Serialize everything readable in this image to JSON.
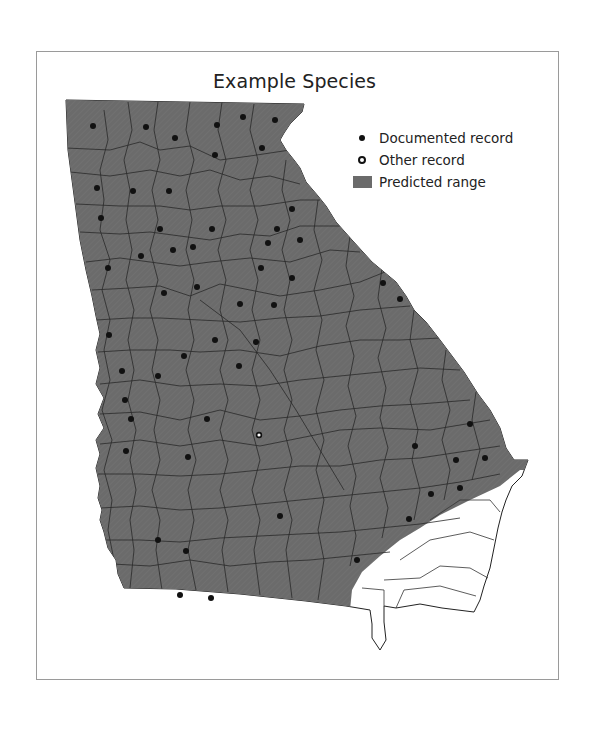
{
  "title": "Example Species",
  "legend": {
    "items": [
      {
        "symbol": "filled-dot",
        "label": "Documented record"
      },
      {
        "symbol": "open-dot",
        "label": "Other record"
      },
      {
        "symbol": "gray-swatch",
        "label": "Predicted range"
      }
    ]
  },
  "colors": {
    "range_fill": "#6b6b6b",
    "county_line": "#2a2a2a",
    "outside_range": "#ffffff",
    "frame": "#9a9a9a",
    "record_dot": "#111111"
  },
  "map": {
    "region": "Georgia (US state) by county",
    "documented_records": [
      [
        93,
        126
      ],
      [
        146,
        127
      ],
      [
        175,
        138
      ],
      [
        217,
        125
      ],
      [
        243,
        117
      ],
      [
        275,
        120
      ],
      [
        215,
        155
      ],
      [
        262,
        148
      ],
      [
        97,
        188
      ],
      [
        133,
        191
      ],
      [
        169,
        191
      ],
      [
        292,
        209
      ],
      [
        101,
        218
      ],
      [
        160,
        229
      ],
      [
        212,
        229
      ],
      [
        277,
        229
      ],
      [
        268,
        243
      ],
      [
        300,
        240
      ],
      [
        141,
        256
      ],
      [
        173,
        250
      ],
      [
        193,
        247
      ],
      [
        108,
        268
      ],
      [
        261,
        268
      ],
      [
        197,
        287
      ],
      [
        292,
        278
      ],
      [
        383,
        283
      ],
      [
        400,
        299
      ],
      [
        164,
        293
      ],
      [
        240,
        304
      ],
      [
        274,
        305
      ],
      [
        109,
        335
      ],
      [
        215,
        340
      ],
      [
        256,
        342
      ],
      [
        184,
        356
      ],
      [
        239,
        366
      ],
      [
        122,
        371
      ],
      [
        158,
        376
      ],
      [
        125,
        400
      ],
      [
        131,
        419
      ],
      [
        207,
        419
      ],
      [
        470,
        424
      ],
      [
        415,
        446
      ],
      [
        456,
        460
      ],
      [
        485,
        458
      ],
      [
        126,
        451
      ],
      [
        188,
        457
      ],
      [
        431,
        494
      ],
      [
        460,
        488
      ],
      [
        280,
        516
      ],
      [
        409,
        519
      ],
      [
        158,
        540
      ],
      [
        186,
        551
      ],
      [
        357,
        560
      ],
      [
        180,
        595
      ],
      [
        211,
        598
      ]
    ],
    "other_records": [
      [
        259,
        435
      ]
    ]
  }
}
